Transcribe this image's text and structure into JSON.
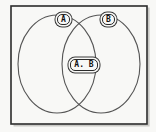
{
  "figure": {
    "type": "venn-diagram",
    "background_color": "#f8f8f6",
    "stroke_color": "#3a3a3a",
    "frame": {
      "name": "universal-set-frame",
      "x": 11,
      "y": 6,
      "width": 136,
      "height": 118,
      "stroke_color": "#2b2b2b",
      "stroke_width": 1.6
    },
    "sets": [
      {
        "id": "set-a",
        "label": "A",
        "cx": 57,
        "cy": 64,
        "rx": 39,
        "ry": 49,
        "stroke_color": "#555555",
        "stroke_width": 1.1,
        "fill": "none"
      },
      {
        "id": "set-b",
        "label": "B",
        "cx": 101,
        "cy": 64,
        "rx": 39,
        "ry": 49,
        "stroke_color": "#555555",
        "stroke_width": 1.1,
        "fill": "none"
      }
    ],
    "labels": [
      {
        "id": "label-a",
        "text": "A",
        "region": "set-a-only",
        "x": 63,
        "y": 20
      },
      {
        "id": "label-b",
        "text": "B",
        "region": "set-b-only",
        "x": 108,
        "y": 20
      },
      {
        "id": "label-ab",
        "text": "A. B",
        "region": "intersection",
        "x": 84,
        "y": 65
      }
    ]
  }
}
